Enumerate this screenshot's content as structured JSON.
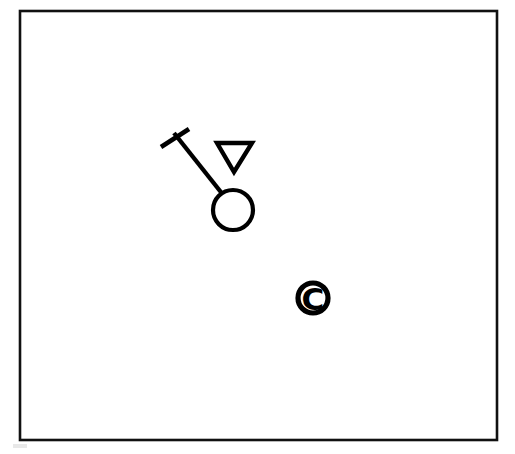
{
  "figure": {
    "background_color": "#ffffff",
    "ink_color": "#000000",
    "frame": {
      "name": "border-frame",
      "x": 20,
      "y": 11,
      "width": 477,
      "height": 429,
      "stroke_color": "#111111",
      "stroke_width": 2.6,
      "fill": "#ffffff"
    },
    "elements": [
      {
        "name": "t-handle",
        "kind": "line",
        "label": "T-shaped handle crossbar",
        "x1": 161,
        "y1": 147,
        "x2": 189,
        "y2": 129,
        "stroke_width": 4.6
      },
      {
        "name": "shaft",
        "kind": "line",
        "label": "Diagonal shaft",
        "x1": 174,
        "y1": 133,
        "x2": 224,
        "y2": 196,
        "stroke_width": 4.4
      },
      {
        "name": "head-circle",
        "kind": "circle",
        "label": "Open circular head",
        "cx": 233,
        "cy": 210,
        "r": 20,
        "stroke_width": 4.2,
        "fill": "#ffffff"
      },
      {
        "name": "inverted-triangle",
        "kind": "polygon",
        "label": "Downward pointing triangle outline",
        "points": "217,143 252,143 234,172",
        "stroke_width": 4.4,
        "fill": "#ffffff"
      },
      {
        "name": "copyright-symbol",
        "kind": "glyph",
        "label": "Copyright symbol",
        "glyph": "C",
        "cx": 313,
        "cy": 298,
        "outer_radius": 15,
        "stroke_width": 5.2
      }
    ],
    "artifact": {
      "name": "scan-artifact",
      "x": 13,
      "y": 444,
      "width": 14,
      "height": 4,
      "color": "#e8e8e8"
    }
  },
  "chart_data": {
    "type": "scatter",
    "xlabel": "",
    "ylabel": "",
    "xlim": [
      20,
      497
    ],
    "ylim": [
      11,
      440
    ],
    "grid": false,
    "legend": "none",
    "annotations": [
      "T-handled implement with circular head",
      "Inverted triangle",
      "Copyright symbol"
    ],
    "categories": [
      "t-handle",
      "shaft",
      "head-circle",
      "inverted-triangle",
      "copyright-symbol"
    ],
    "values": [
      1,
      1,
      1,
      1,
      1
    ]
  }
}
